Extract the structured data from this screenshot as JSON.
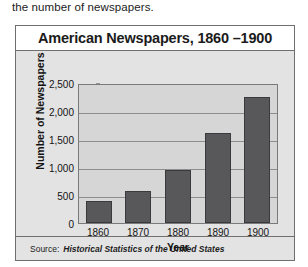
{
  "caption": "the number of newspapers.",
  "figure": {
    "title": "American Newspapers, 1860 –1900",
    "source_label": "Source:",
    "source_title": "Historical Statistics of the United States"
  },
  "chart_data": {
    "type": "bar",
    "title": "American Newspapers, 1860 –1900",
    "categories": [
      "1860",
      "1870",
      "1880",
      "1890",
      "1900"
    ],
    "values": [
      390,
      570,
      950,
      1600,
      2250
    ],
    "series": [
      {
        "name": "Number of Newspapers",
        "values": [
          390,
          570,
          950,
          1600,
          2250
        ]
      }
    ],
    "xlabel": "Year",
    "ylabel": "Number of Newspapers",
    "ylim": [
      0,
      2500
    ],
    "ytick_values": [
      0,
      500,
      1000,
      1500,
      2000,
      2500
    ],
    "ytick_labels": [
      "0",
      "500",
      "1,000",
      "1,500",
      "2,000",
      "2,500"
    ],
    "grid": true,
    "legend": false,
    "bar_color": "#58585a",
    "plot_background": "#d6d6d6",
    "source": "Historical Statistics of the United States"
  }
}
